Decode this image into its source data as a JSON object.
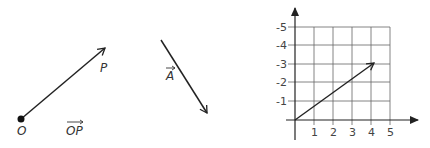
{
  "panel1": {
    "origin_label": "O",
    "point_label": "P",
    "vector_label": "OP"
  },
  "panel2": {
    "vector_label": "A"
  },
  "panel3": {
    "x_ticks": [
      "1",
      "2",
      "3",
      "4",
      "5"
    ],
    "y_ticks": [
      "-1",
      "-2",
      "-3",
      "-4",
      "-5"
    ],
    "vector_tip": {
      "x": 4,
      "y": 3
    }
  },
  "colors": {
    "line": "#222222",
    "grid": "#555555"
  }
}
